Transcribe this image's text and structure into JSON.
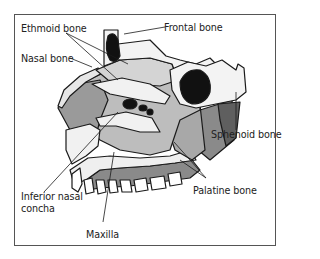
{
  "diagram": {
    "labels": {
      "ethmoid": "Ethmoid bone",
      "nasal": "Nasal bone",
      "frontal": "Frontal bone",
      "sphenoid": "Sphenoid bone",
      "palatine": "Palatine bone",
      "inferior_concha_line1": "Inferior nasal",
      "inferior_concha_line2": "concha",
      "maxilla": "Maxilla"
    },
    "colors": {
      "outline": "#1a1a1a",
      "light_bone": "#efefef",
      "mid_gray": "#bdbdbd",
      "dark_gray": "#8a8a8a",
      "cavity": "#111111",
      "frame": "#555555"
    }
  }
}
